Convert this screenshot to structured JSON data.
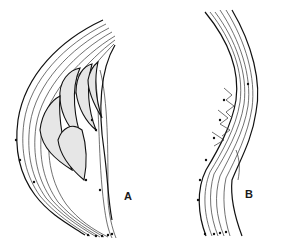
{
  "figure": {
    "panels": [
      {
        "id": "A",
        "label": "A",
        "description": "Curved bundle of flow lines with stippled elongated lobes inside, arrowheads along lines pointing downward"
      },
      {
        "id": "B",
        "label": "B",
        "description": "Narrower S-curved bundle of flow lines with small branching structures in the middle, arrowheads along lines pointing downward"
      }
    ],
    "colors": {
      "line": "#111111",
      "stipple": "#e6e6e6",
      "background": "#ffffff"
    }
  }
}
